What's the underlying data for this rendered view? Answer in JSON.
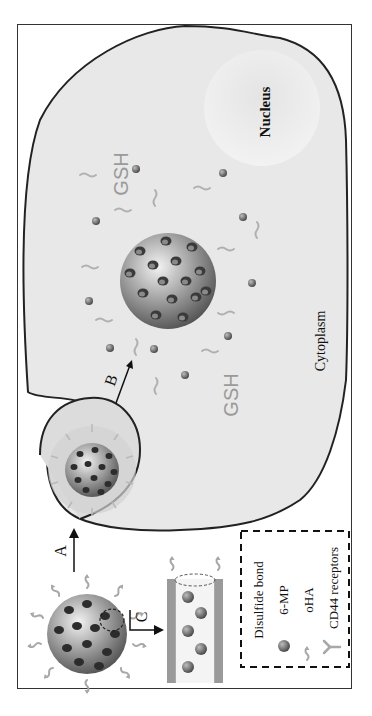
{
  "figure": {
    "orientation": "rotated-90-ccw",
    "labels": {
      "nucleus": "Nucleus",
      "cytoplasm": "Cytoplasm",
      "gsh_top": "GSH",
      "gsh_bottom": "GSH",
      "arrow_a": "A",
      "arrow_b": "B",
      "arrow_c": "C"
    },
    "legend": {
      "items": [
        {
          "icon": "disulfide-bond-icon",
          "label": "Disulfide bond"
        },
        {
          "icon": "drug-particle-icon",
          "label": "6-MP"
        },
        {
          "icon": "oha-chain-icon",
          "label": "oHA"
        },
        {
          "icon": "receptor-icon",
          "label": "CD44 receptors"
        }
      ]
    },
    "colors": {
      "cytoplasm": "#e6e6e6",
      "cell_outline": "#222222",
      "nanoparticle": "#8a8a8a",
      "drug": "#6e6e6e",
      "oha": "#a8a8a8",
      "gsh_text": "#9a9a9a"
    }
  }
}
